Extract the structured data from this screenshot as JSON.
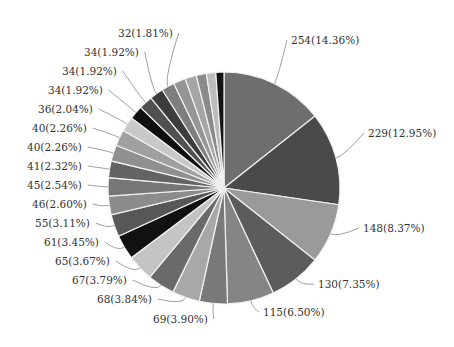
{
  "chart_data": {
    "type": "pie",
    "title": "",
    "center": [
      224,
      188
    ],
    "radius": 116,
    "start_angle_deg": -90,
    "direction": "clockwise",
    "slices": [
      {
        "value": 254,
        "label": "254(14.36%)",
        "color": "#6e6e6e",
        "labelPos": [
          311,
          43
        ],
        "anchor": "start"
      },
      {
        "value": 229,
        "label": "229(12.95%)",
        "color": "#4a4a4a",
        "labelPos": [
          368,
          138
        ],
        "anchor": "start"
      },
      {
        "value": 148,
        "label": "148(8.37%)",
        "color": "#9a9a9a",
        "labelPos": [
          363,
          232
        ],
        "anchor": "start"
      },
      {
        "value": 130,
        "label": "130(7.35%)",
        "color": "#5c5c5c",
        "labelPos": [
          318,
          288
        ],
        "anchor": "start"
      },
      {
        "value": 115,
        "label": "115(6.50%)",
        "color": "#858585",
        "labelPos": [
          263,
          316
        ],
        "anchor": "start"
      },
      {
        "value": 69,
        "label": "69(3.90%)",
        "color": "#7a7a7a",
        "labelPos": [
          153,
          299
        ],
        "anchor": "start"
      },
      {
        "value": 68,
        "label": "68(3.84%)",
        "color": "#a8a8a8",
        "labelPos": [
          97,
          283
        ],
        "anchor": "start"
      },
      {
        "value": 67,
        "label": "67(3.79%)",
        "color": "#6a6a6a",
        "labelPos": [
          72,
          274
        ],
        "anchor": "start"
      },
      {
        "value": 65,
        "label": "65(3.67%)",
        "color": "#c4c4c4",
        "labelPos": [
          55,
          93
        ],
        "anchor": "start"
      },
      {
        "value": 61,
        "label": "61(3.45%)",
        "color": "#111111",
        "labelPos": [
          44,
          75
        ],
        "anchor": "start"
      },
      {
        "value": 55,
        "label": "55(3.11%)",
        "color": "#575757",
        "labelPos": [
          35,
          57
        ],
        "anchor": "start"
      },
      {
        "value": 46,
        "label": "46(2.60%)",
        "color": "#8c8c8c",
        "labelPos": [
          32,
          38
        ],
        "anchor": "start"
      },
      {
        "value": 45,
        "label": "45(2.54%)",
        "color": "#767676",
        "labelPos": [
          27,
          19
        ],
        "anchor": "start"
      },
      {
        "value": 41,
        "label": "41(2.32%)",
        "color": "#636363",
        "labelPos": [
          27,
          0
        ],
        "anchor": "start"
      },
      {
        "value": 40,
        "label": "40(2.26%)",
        "color": "#909090",
        "labelPos": [
          27,
          0
        ],
        "anchor": "start"
      },
      {
        "value": 40,
        "label": "40(2.26%)",
        "color": "#a0a0a0",
        "labelPos": [
          32,
          0
        ],
        "anchor": "start"
      },
      {
        "value": 36,
        "label": "36(2.04%)",
        "color": "#c8c8c8",
        "labelPos": [
          38,
          0
        ],
        "anchor": "start"
      },
      {
        "value": 34,
        "label": "34(1.92%)",
        "color": "#0f0f0f",
        "labelPos": [
          48,
          0
        ],
        "anchor": "start"
      },
      {
        "value": 34,
        "label": "34(1.92%)",
        "color": "#505050",
        "labelPos": [
          62,
          0
        ],
        "anchor": "start"
      },
      {
        "value": 34,
        "label": "34(1.92%)",
        "color": "#3c3c3c",
        "labelPos": [
          83,
          0
        ],
        "anchor": "start"
      },
      {
        "value": 32,
        "label": "32(1.81%)",
        "color": "#7e7e7e",
        "labelPos": [
          118,
          0
        ],
        "anchor": "start"
      },
      {
        "value": 30,
        "label": "",
        "color": "#959595"
      },
      {
        "value": 28,
        "label": "",
        "color": "#a5a5a5"
      },
      {
        "value": 25,
        "label": "",
        "color": "#8a8a8a"
      },
      {
        "value": 23,
        "label": "",
        "color": "#bdbdbd"
      },
      {
        "value": 20,
        "label": "",
        "color": "#141414"
      }
    ],
    "labels_left": [
      {
        "text": "32(1.81%)",
        "x": 118,
        "y": 37
      },
      {
        "text": "34(1.92%)",
        "x": 84,
        "y": 56
      },
      {
        "text": "34(1.92%)",
        "x": 62,
        "y": 75
      },
      {
        "text": "34(1.92%)",
        "x": 48,
        "y": 94
      },
      {
        "text": "36(2.04%)",
        "x": 38,
        "y": 113
      },
      {
        "text": "40(2.26%)",
        "x": 32,
        "y": 132
      },
      {
        "text": "40(2.26%)",
        "x": 27,
        "y": 151
      },
      {
        "text": "41(2.32%)",
        "x": 27,
        "y": 170
      },
      {
        "text": "45(2.54%)",
        "x": 27,
        "y": 189
      },
      {
        "text": "46(2.60%)",
        "x": 32,
        "y": 208
      },
      {
        "text": "55(3.11%)",
        "x": 35,
        "y": 227
      },
      {
        "text": "61(3.45%)",
        "x": 44,
        "y": 246
      },
      {
        "text": "65(3.67%)",
        "x": 55,
        "y": 265
      },
      {
        "text": "67(3.79%)",
        "x": 72,
        "y": 284
      },
      {
        "text": "68(3.84%)",
        "x": 97,
        "y": 303
      },
      {
        "text": "69(3.90%)",
        "x": 153,
        "y": 323
      }
    ],
    "labels_right": [
      {
        "text": "254(14.36%)",
        "x": 291,
        "y": 44
      },
      {
        "text": "229(12.95%)",
        "x": 368,
        "y": 137
      },
      {
        "text": "148(8.37%)",
        "x": 363,
        "y": 232
      },
      {
        "text": "130(7.35%)",
        "x": 318,
        "y": 288
      },
      {
        "text": "115(6.50%)",
        "x": 263,
        "y": 316
      }
    ],
    "legend": "none",
    "grid": false
  }
}
